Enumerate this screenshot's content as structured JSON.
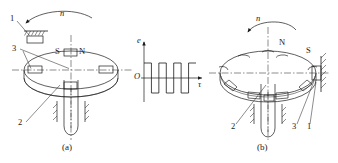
{
  "figure": {
    "title_a": "(a)",
    "title_b": "(b)",
    "panel_a": {
      "rotation_label": "n",
      "callouts": [
        {
          "id": "1",
          "text": "1"
        },
        {
          "id": "2",
          "text": "2"
        },
        {
          "id": "3",
          "text": "3"
        }
      ],
      "pole_south": "S",
      "pole_north": "N"
    },
    "panel_b": {
      "rotation_label": "n",
      "callouts": [
        {
          "id": "1",
          "text": "1"
        },
        {
          "id": "2",
          "text": "2"
        },
        {
          "id": "3",
          "text": "3"
        }
      ],
      "pole_north": "N",
      "pole_south": "S"
    }
  },
  "chart_data": {
    "type": "line",
    "title": "",
    "xlabel": "τ",
    "ylabel": "e",
    "origin_label": "O",
    "x": [
      0,
      1,
      1,
      2,
      2,
      3,
      3,
      4,
      4,
      5,
      5,
      6,
      6,
      7
    ],
    "values": [
      1,
      1,
      -1,
      -1,
      1,
      1,
      -1,
      -1,
      1,
      1,
      -1,
      -1,
      1,
      1
    ],
    "ylim": [
      -1.4,
      1.4
    ],
    "xlim": [
      0,
      8.2
    ],
    "grid": false,
    "legend": null,
    "waveform": "square",
    "cycles": 3,
    "amplitude": 1,
    "duty_cycle": 0.5
  },
  "colors": {
    "stroke": "#1a1a1a",
    "background": "#ffffff",
    "hatch": "#1a1a1a"
  }
}
